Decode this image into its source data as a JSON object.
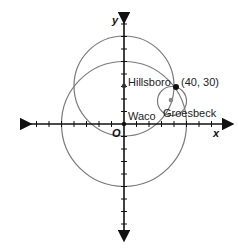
{
  "diagram": {
    "type": "coordinate-plane-circles",
    "axes": {
      "x_label": "x",
      "y_label": "y",
      "origin_label": "O",
      "tick_spacing_units": 10
    },
    "points": [
      {
        "name": "Hillsboro",
        "label": "Hillsboro",
        "x": 0,
        "y": 30
      },
      {
        "name": "Waco",
        "label": "Waco",
        "x": 0,
        "y": 0
      },
      {
        "name": "Groesbeck",
        "label": "Groesbeck",
        "x": 37,
        "y": 18
      },
      {
        "name": "intersection",
        "label": "(40, 30)",
        "x": 40,
        "y": 30
      }
    ],
    "circles": [
      {
        "center": "Waco",
        "radius": 50
      },
      {
        "center": "Hillsboro",
        "radius": 40
      },
      {
        "center": "Groesbeck",
        "radius": 12
      }
    ],
    "colors": {
      "circle": "#777777",
      "axis": "#111111",
      "point": "#111111",
      "gray_point": "#888888"
    }
  }
}
